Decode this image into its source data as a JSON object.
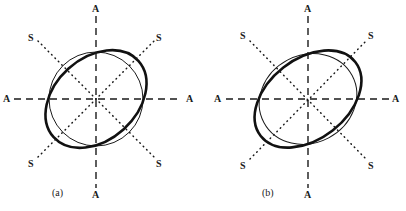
{
  "figure": {
    "background": "#ffffff",
    "ink": "#1a1a1a",
    "panels": [
      {
        "id": "a",
        "caption": "(a)",
        "caption_pos": {
          "x": 52,
          "y": 189
        },
        "center": {
          "x": 96,
          "y": 99
        },
        "axes": [
          {
            "name": "vertical-a-axis",
            "style": "dashed",
            "label": "A",
            "label_top": "A",
            "label_bottom": "A",
            "from": {
              "x": 96,
              "y": 16
            },
            "to": {
              "x": 96,
              "y": 188
            },
            "label_top_pos": {
              "x": 92,
              "y": 5
            },
            "label_bottom_pos": {
              "x": 92,
              "y": 190
            }
          },
          {
            "name": "horizontal-a-axis",
            "style": "dashed",
            "label": "A",
            "label_left": "A",
            "label_right": "A",
            "from": {
              "x": 14,
              "y": 99
            },
            "to": {
              "x": 182,
              "y": 99
            },
            "label_left_pos": {
              "x": 3,
              "y": 94
            },
            "label_right_pos": {
              "x": 186,
              "y": 94
            }
          },
          {
            "name": "diagonal-s-axis-ne",
            "style": "dotted",
            "label": "S",
            "from": {
              "x": 40,
              "y": 155
            },
            "to": {
              "x": 152,
              "y": 43
            },
            "label_ne_pos": {
              "x": 157,
              "y": 35
            },
            "label_sw_pos": {
              "x": 29,
              "y": 160
            }
          },
          {
            "name": "diagonal-s-axis-nw",
            "style": "dotted",
            "label": "S",
            "from": {
              "x": 40,
              "y": 43
            },
            "to": {
              "x": 152,
              "y": 155
            },
            "label_nw_pos": {
              "x": 29,
              "y": 35
            },
            "label_se_pos": {
              "x": 157,
              "y": 160
            }
          }
        ],
        "curves": [
          {
            "name": "thin-circle",
            "weight": "thin",
            "stroke_width": 1,
            "shape": "circle",
            "rx": 47,
            "ry": 47,
            "rotation": 0
          },
          {
            "name": "bold-ellipse",
            "weight": "bold",
            "stroke_width": 2.6,
            "shape": "ellipse",
            "rx": 57,
            "ry": 41,
            "rotation": -42
          }
        ]
      },
      {
        "id": "b",
        "caption": "(b)",
        "caption_pos": {
          "x": 262,
          "y": 189
        },
        "center": {
          "x": 308,
          "y": 99
        },
        "axes": [
          {
            "name": "vertical-a-axis",
            "style": "dashed",
            "label": "A",
            "label_top": "A",
            "label_bottom": "A",
            "from": {
              "x": 308,
              "y": 16
            },
            "to": {
              "x": 308,
              "y": 188
            },
            "label_top_pos": {
              "x": 304,
              "y": 5
            },
            "label_bottom_pos": {
              "x": 304,
              "y": 190
            }
          },
          {
            "name": "horizontal-a-axis",
            "style": "dashed",
            "label": "A",
            "label_left": "A",
            "label_right": "A",
            "from": {
              "x": 226,
              "y": 99
            },
            "to": {
              "x": 390,
              "y": 99
            },
            "label_left_pos": {
              "x": 214,
              "y": 94
            },
            "label_right_pos": {
              "x": 392,
              "y": 94
            }
          },
          {
            "name": "diagonal-s-axis-ne",
            "style": "dotted",
            "label": "S",
            "from": {
              "x": 252,
              "y": 155
            },
            "to": {
              "x": 364,
              "y": 43
            },
            "label_ne_pos": {
              "x": 369,
              "y": 33
            },
            "label_sw_pos": {
              "x": 240,
              "y": 162
            }
          },
          {
            "name": "diagonal-s-axis-nw",
            "style": "dotted",
            "label": "S",
            "from": {
              "x": 252,
              "y": 43
            },
            "to": {
              "x": 364,
              "y": 155
            },
            "label_nw_pos": {
              "x": 240,
              "y": 33
            },
            "label_se_pos": {
              "x": 369,
              "y": 162
            }
          }
        ],
        "curves": [
          {
            "name": "thin-ellipse",
            "weight": "thin",
            "stroke_width": 1,
            "shape": "ellipse",
            "rx": 50,
            "ry": 44,
            "rotation": -28
          },
          {
            "name": "bold-ellipse",
            "weight": "bold",
            "stroke_width": 2.6,
            "shape": "ellipse",
            "rx": 60,
            "ry": 40,
            "rotation": -38
          }
        ]
      }
    ]
  }
}
